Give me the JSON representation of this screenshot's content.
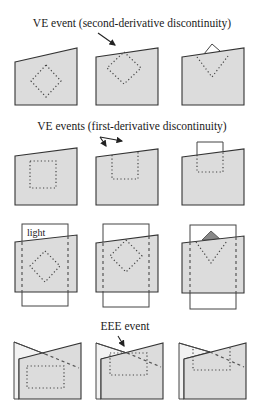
{
  "labels": {
    "row1_title": "VE event (second-derivative discontinuity)",
    "row2_title": "VE events (first-derivative discontinuity)",
    "row3_light": "light",
    "row4_title": "EEE event"
  },
  "colors": {
    "panel_fill": "#dcdcdc",
    "stroke": "#333333",
    "shadow_triangle": "#888888",
    "background": "#ffffff"
  },
  "rows": [
    {
      "name": "ve-second-derivative",
      "panels": 3,
      "feature": "dotted diamond approaching/crossing sloped edge"
    },
    {
      "name": "ve-first-derivative",
      "panels": 3,
      "feature": "dotted square approaching/crossing sloped edge"
    },
    {
      "name": "lighting",
      "panels": 3,
      "feature": "light rectangle behind panel with dashed verticals and dotted diamond"
    },
    {
      "name": "eee-event",
      "panels": 3,
      "feature": "overlapping planes with dotted rectangle and dashed line"
    }
  ]
}
